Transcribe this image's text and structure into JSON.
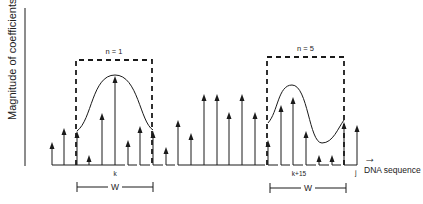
{
  "diagram": {
    "y_axis_label": "Magnitude of coefficients",
    "x_axis_label": "DNA sequence",
    "x_axis_arrow": "→",
    "colors": {
      "ink": "#1a1a1a",
      "background": "#ffffff"
    },
    "baseline_y": 165,
    "arrows": [
      {
        "x": 52,
        "top": 142
      },
      {
        "x": 64,
        "top": 128
      },
      {
        "x": 77,
        "top": 131
      },
      {
        "x": 89,
        "top": 155
      },
      {
        "x": 102,
        "top": 113
      },
      {
        "x": 115,
        "top": 76
      },
      {
        "x": 128,
        "top": 140
      },
      {
        "x": 140,
        "top": 126
      },
      {
        "x": 153,
        "top": 131
      },
      {
        "x": 166,
        "top": 147
      },
      {
        "x": 178,
        "top": 120
      },
      {
        "x": 191,
        "top": 133
      },
      {
        "x": 204,
        "top": 94
      },
      {
        "x": 217,
        "top": 94
      },
      {
        "x": 229,
        "top": 112
      },
      {
        "x": 242,
        "top": 94
      },
      {
        "x": 255,
        "top": 112
      },
      {
        "x": 268,
        "top": 140
      },
      {
        "x": 281,
        "top": 105
      },
      {
        "x": 293,
        "top": 97
      },
      {
        "x": 306,
        "top": 131
      },
      {
        "x": 319,
        "top": 155
      },
      {
        "x": 332,
        "top": 155
      },
      {
        "x": 344,
        "top": 122
      },
      {
        "x": 357,
        "top": 125
      }
    ],
    "windows": [
      {
        "label": "n = 1",
        "box": {
          "x1": 76,
          "y1": 60,
          "x2": 152,
          "y2": 165
        },
        "position_label": "k",
        "position_x": 115,
        "width_label": "W",
        "width_bar": {
          "x1": 77,
          "x2": 153,
          "y": 187
        },
        "curve": "M77,131 C92,120 92,75 115,75 C138,75 140,122 153,130"
      },
      {
        "label": "n = 5",
        "box": {
          "x1": 267,
          "y1": 57,
          "x2": 344,
          "y2": 165
        },
        "position_label": "k+15",
        "position_x": 299,
        "width_label": "W",
        "width_bar": {
          "x1": 270,
          "x2": 346,
          "y": 188
        },
        "curve": "M268,123 C278,112 278,85 292,85 C308,85 309,143 322,143 C333,143 338,128 344,120"
      }
    ],
    "end_label": "j",
    "end_x": 357
  }
}
